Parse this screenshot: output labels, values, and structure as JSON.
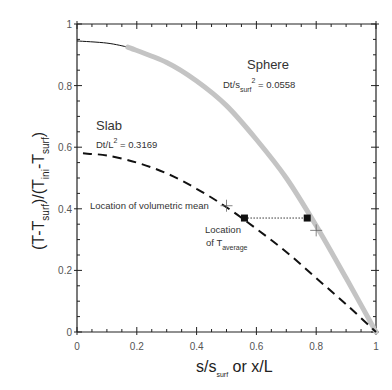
{
  "chart_data": {
    "type": "line",
    "title": "",
    "xlabel": "s/s_surf or x/L",
    "xlabel_parts": {
      "main1": "s/s",
      "sub": "surf",
      "main2": " or x/L"
    },
    "ylabel": "(T-T_surf)/(T_ini-T_surf)",
    "ylabel_parts": {
      "p1": "(T-T",
      "s1": "surf",
      "p2": ")/(T",
      "s2": "ini",
      "p3": "-T",
      "s3": "surf",
      "p4": ")"
    },
    "xlim": [
      0,
      1
    ],
    "ylim": [
      0,
      1
    ],
    "x_ticks": [
      "0",
      "0.2",
      "0.4",
      "0.6",
      "0.8",
      "1"
    ],
    "y_ticks": [
      "0",
      "0.2",
      "0.4",
      "0.6",
      "0.8",
      "1"
    ],
    "grid": false,
    "series": [
      {
        "name": "Sphere",
        "style": "solid black then thick gray band",
        "x": [
          0,
          0.1,
          0.17,
          0.3,
          0.4,
          0.5,
          0.6,
          0.7,
          0.8,
          0.9,
          1.0
        ],
        "y": [
          0.945,
          0.938,
          0.925,
          0.875,
          0.815,
          0.735,
          0.625,
          0.5,
          0.345,
          0.175,
          0.0
        ],
        "annotation": {
          "label": "Sphere",
          "param_prefix": "Dt/s",
          "param_sub": "surf",
          "param_sup": "2",
          "param_value": " = 0.0558"
        }
      },
      {
        "name": "Slab",
        "style": "dashed black",
        "x": [
          0.02,
          0.1,
          0.2,
          0.3,
          0.4,
          0.5,
          0.6,
          0.7,
          0.8,
          0.9,
          1.0
        ],
        "y": [
          0.58,
          0.573,
          0.55,
          0.515,
          0.465,
          0.405,
          0.335,
          0.26,
          0.175,
          0.09,
          0.0
        ],
        "annotation": {
          "label": "Slab",
          "param_prefix": "Dt/L",
          "param_sup": "2",
          "param_value": " = 0.3169"
        }
      }
    ],
    "markers": {
      "t_average_points": [
        {
          "x": 0.56,
          "y": 0.37
        },
        {
          "x": 0.77,
          "y": 0.37
        }
      ],
      "volumetric_mean_points": [
        {
          "x": 0.5,
          "y": 0.41
        },
        {
          "x": 0.8,
          "y": 0.33
        }
      ]
    },
    "annotations": {
      "volumetric_mean": "Location of volumetric mean",
      "t_average_line1": "Location",
      "t_average_line2_prefix": "of T",
      "t_average_sub": "average"
    }
  }
}
